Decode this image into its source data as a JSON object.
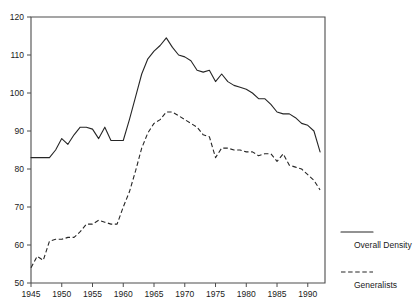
{
  "chart_data": {
    "type": "line",
    "title": "",
    "xlabel": "",
    "ylabel": "",
    "xlim": [
      1945,
      1992.8
    ],
    "ylim": [
      50,
      120
    ],
    "grid": false,
    "legend_position": "right",
    "x_ticks": [
      1945,
      1950,
      1955,
      1960,
      1965,
      1970,
      1975,
      1980,
      1985,
      1990
    ],
    "y_ticks": [
      50,
      60,
      70,
      80,
      90,
      100,
      110,
      120
    ],
    "x": [
      1945,
      1946,
      1947,
      1948,
      1949,
      1950,
      1951,
      1952,
      1953,
      1954,
      1955,
      1956,
      1957,
      1958,
      1959,
      1960,
      1961,
      1962,
      1963,
      1964,
      1965,
      1966,
      1967,
      1968,
      1969,
      1970,
      1971,
      1972,
      1973,
      1974,
      1975,
      1976,
      1977,
      1978,
      1979,
      1980,
      1981,
      1982,
      1983,
      1984,
      1985,
      1986,
      1987,
      1988,
      1989,
      1990,
      1991,
      1992
    ],
    "series": [
      {
        "name": "Overall Density",
        "style": "solid",
        "values": [
          83,
          83,
          83,
          83,
          85,
          88,
          86.5,
          89,
          91,
          91,
          90.5,
          88,
          91,
          87.5,
          87.5,
          87.5,
          93,
          99,
          105,
          109,
          111,
          112.5,
          114.5,
          112,
          110,
          109.5,
          108.5,
          106,
          105.5,
          106,
          103,
          105,
          103,
          102,
          101.5,
          101,
          100,
          98.5,
          98.5,
          97,
          95,
          94.5,
          94.5,
          93.5,
          92,
          91.5,
          90,
          84.5
        ]
      },
      {
        "name": "Generalists",
        "style": "dashed",
        "values": [
          54,
          57,
          56,
          61,
          61.5,
          61.5,
          62,
          62,
          63.5,
          65.5,
          65.5,
          66.5,
          66,
          65.5,
          65.5,
          70,
          74,
          79.5,
          85.5,
          89.5,
          92,
          93,
          95,
          95,
          94,
          93,
          92,
          91,
          89,
          88.5,
          83,
          85.5,
          85.5,
          85,
          85,
          84.5,
          84.5,
          83.5,
          84,
          84,
          82,
          84,
          81,
          80.5,
          80,
          78.5,
          77,
          74.5
        ]
      }
    ],
    "legend": [
      {
        "label": "Overall Density",
        "style": "solid"
      },
      {
        "label": "Generalists",
        "style": "dashed"
      }
    ]
  },
  "axes": {
    "x_tick_labels": [
      "1945",
      "1950",
      "1955",
      "1960",
      "1965",
      "1970",
      "1975",
      "1980",
      "1985",
      "1990"
    ],
    "y_tick_labels": [
      "50",
      "60",
      "70",
      "80",
      "90",
      "100",
      "110",
      "120"
    ]
  },
  "colors": {
    "line": "#262626",
    "axis": "#4d4d4d",
    "text": "#1a1a1a",
    "background": "#ffffff"
  }
}
